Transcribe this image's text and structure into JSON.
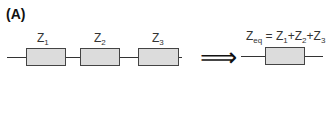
{
  "panel_label": "(A)",
  "series_circuit": {
    "impedances": [
      {
        "symbol": "Z",
        "subscript": "1"
      },
      {
        "symbol": "Z",
        "subscript": "2"
      },
      {
        "symbol": "Z",
        "subscript": "3"
      }
    ]
  },
  "arrow": {
    "icon": "double-right-arrow-icon",
    "glyph": "⟹"
  },
  "equivalent": {
    "lhs_symbol": "Z",
    "lhs_subscript": "eq",
    "equals": " = ",
    "terms": [
      {
        "symbol": "Z",
        "subscript": "1",
        "sep": "+"
      },
      {
        "symbol": "Z",
        "subscript": "2",
        "sep": "+"
      },
      {
        "symbol": "Z",
        "subscript": "3",
        "sep": ""
      }
    ]
  },
  "colors": {
    "box_fill": "#dcdcdc",
    "stroke": "#444444"
  }
}
